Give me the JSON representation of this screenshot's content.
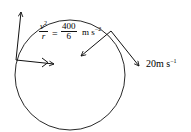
{
  "diagram": {
    "type": "circular-motion",
    "formula": {
      "lhs_numerator": "v",
      "lhs_numerator_power": "2",
      "lhs_denominator": "r",
      "equals": "=",
      "rhs_numerator": "400",
      "rhs_denominator": "6",
      "unit": "m s",
      "unit_power": "−2"
    },
    "speed_label": {
      "value": "20",
      "unit": "m s",
      "unit_power": "−1"
    },
    "colors": {
      "stroke": "#111111",
      "background": "#ffffff"
    }
  }
}
